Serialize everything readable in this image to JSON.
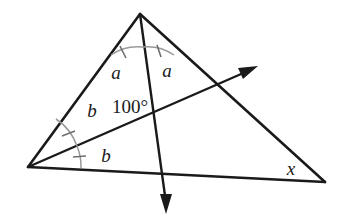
{
  "figure": {
    "background_color": "#ffffff",
    "stroke_color": "#1a1a1a",
    "arc_color": "#999999",
    "tick_color": "#6e6e6e",
    "label_color": "#1a1a1a"
  },
  "labels": {
    "angle_a_left": "a",
    "angle_a_right": "a",
    "angle_b_upper": "b",
    "angle_b_lower": "b",
    "angle_100": "100°",
    "angle_x": "x"
  },
  "vertices": {
    "apex": {
      "name": "apex-vertex",
      "x": 140,
      "y": 14
    },
    "left": {
      "name": "left-vertex",
      "x": 28,
      "y": 167
    },
    "right": {
      "name": "right-vertex",
      "x": 325,
      "y": 182
    }
  },
  "segments": {
    "left_edge": {
      "name": "left-edge",
      "x1": 140,
      "y1": 14,
      "x2": 28,
      "y2": 167
    },
    "right_edge": {
      "name": "right-edge",
      "x1": 140,
      "y1": 14,
      "x2": 325,
      "y2": 182
    },
    "bottom_edge": {
      "name": "bottom-edge",
      "x1": 28,
      "y1": 167,
      "x2": 325,
      "y2": 182
    },
    "cevian_ray": {
      "name": "cevian-ray-down",
      "x1": 140,
      "y1": 14,
      "x2": 166,
      "y2": 205
    },
    "bisector_ray": {
      "name": "bisector-ray-up-right",
      "x1": 28,
      "y1": 167,
      "x2": 250,
      "y2": 70
    }
  },
  "arrows": {
    "down_arrow_tip": {
      "name": "down-arrow-tip",
      "x": 166,
      "y": 213
    },
    "up_right_arrow_tip": {
      "name": "up-right-arrow-tip",
      "x": 257,
      "y": 66
    }
  },
  "intersections": {
    "rays_cross": {
      "name": "rays-intersection",
      "x": 153,
      "y": 110
    },
    "cevian_base": {
      "name": "cevian-base-point",
      "x": 165,
      "y": 177
    },
    "ray_right_edge": {
      "name": "ray-right-edge-point",
      "x": 218,
      "y": 86
    }
  },
  "markings": {
    "apex_left_arc_ticks": 1,
    "apex_right_arc_ticks": 1,
    "left_upper_arc_ticks": 1,
    "left_lower_arc_ticks": 1
  }
}
